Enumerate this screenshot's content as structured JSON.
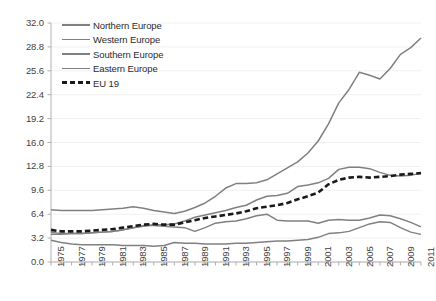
{
  "chart_data": {
    "type": "line",
    "title": "",
    "subtitle": "",
    "xlabel": "",
    "ylabel": "",
    "xlim": [
      1975,
      2011
    ],
    "ylim": [
      0.0,
      32.0
    ],
    "grid": true,
    "legend_position": "top-left",
    "y_ticks": [
      "0.0",
      "3.2",
      "6.4",
      "9.6",
      "12.8",
      "16.0",
      "19.2",
      "22.4",
      "25.6",
      "28.8",
      "32.0"
    ],
    "y_tick_values": [
      0.0,
      3.2,
      6.4,
      9.6,
      12.8,
      16.0,
      19.2,
      22.4,
      25.6,
      28.8,
      32.0
    ],
    "x_tick_labels": [
      "1975",
      "1977",
      "1979",
      "1981",
      "1983",
      "1985",
      "1987",
      "1989",
      "1991",
      "1993",
      "1995",
      "1997",
      "1999",
      "2001",
      "2003",
      "2005",
      "2007",
      "2009",
      "2011"
    ],
    "x": [
      1975,
      1976,
      1977,
      1978,
      1979,
      1980,
      1981,
      1982,
      1983,
      1984,
      1985,
      1986,
      1987,
      1988,
      1989,
      1990,
      1991,
      1992,
      1993,
      1994,
      1995,
      1996,
      1997,
      1998,
      1999,
      2000,
      2001,
      2002,
      2003,
      2004,
      2005,
      2006,
      2007,
      2008,
      2009,
      2010,
      2011
    ],
    "series": [
      {
        "name": "Northern Europe",
        "style": "solid",
        "color": "#808080",
        "values": [
          7.0,
          6.9,
          6.9,
          6.9,
          6.9,
          7.0,
          7.1,
          7.2,
          7.4,
          7.2,
          6.9,
          6.7,
          6.5,
          6.8,
          7.3,
          7.9,
          8.8,
          9.9,
          10.5,
          10.5,
          10.6,
          11.0,
          11.8,
          12.6,
          13.4,
          14.6,
          16.2,
          18.5,
          21.3,
          23.1,
          25.4,
          25.0,
          24.5,
          25.9,
          27.8,
          28.7,
          30.0
        ]
      },
      {
        "name": "Western Europe",
        "style": "solid",
        "color": "#808080",
        "values": [
          4.0,
          3.8,
          3.8,
          3.8,
          3.9,
          4.0,
          4.1,
          4.3,
          4.6,
          4.8,
          5.0,
          5.0,
          5.1,
          5.5,
          6.0,
          6.3,
          6.6,
          6.9,
          7.3,
          7.6,
          8.3,
          8.8,
          8.9,
          9.2,
          10.1,
          10.3,
          10.6,
          11.2,
          12.4,
          12.7,
          12.7,
          12.5,
          12.0,
          11.6,
          11.5,
          11.6,
          11.9
        ]
      },
      {
        "name": "Southern Europe",
        "style": "solid",
        "color": "#808080",
        "values": [
          3.7,
          3.7,
          3.8,
          3.8,
          3.9,
          4.0,
          4.1,
          4.3,
          4.6,
          4.9,
          4.9,
          4.8,
          4.7,
          4.6,
          4.1,
          4.6,
          5.2,
          5.4,
          5.5,
          5.8,
          6.2,
          6.4,
          5.6,
          5.5,
          5.5,
          5.5,
          5.2,
          5.6,
          5.7,
          5.6,
          5.6,
          5.9,
          6.3,
          6.2,
          5.8,
          5.3,
          4.7
        ]
      },
      {
        "name": "Eastern Europe",
        "style": "solid",
        "color": "#808080",
        "values": [
          2.9,
          2.6,
          2.4,
          2.3,
          2.3,
          2.3,
          2.3,
          2.2,
          2.2,
          2.2,
          2.1,
          2.2,
          2.6,
          2.5,
          2.5,
          2.4,
          2.4,
          2.4,
          2.5,
          2.5,
          2.6,
          2.7,
          2.8,
          2.8,
          2.9,
          3.0,
          3.3,
          3.8,
          3.9,
          4.1,
          4.6,
          5.1,
          5.4,
          5.3,
          4.6,
          4.0,
          3.7
        ]
      },
      {
        "name": "EU 19",
        "style": "dashed",
        "color": "#1a1a1a",
        "values": [
          4.3,
          4.1,
          4.1,
          4.1,
          4.2,
          4.3,
          4.4,
          4.6,
          4.8,
          5.0,
          5.1,
          5.0,
          5.0,
          5.3,
          5.6,
          5.9,
          6.1,
          6.3,
          6.5,
          6.8,
          7.2,
          7.4,
          7.6,
          7.9,
          8.4,
          8.8,
          9.3,
          10.4,
          11.0,
          11.3,
          11.4,
          11.3,
          11.4,
          11.5,
          11.7,
          11.8,
          11.9
        ]
      }
    ]
  },
  "legend": {
    "entries": [
      {
        "label": "Northern Europe",
        "style": "solid"
      },
      {
        "label": "Western Europe",
        "style": "solid"
      },
      {
        "label": "Southern Europe",
        "style": "solid"
      },
      {
        "label": "Eastern Europe",
        "style": "solid"
      },
      {
        "label": "EU 19",
        "style": "dashed"
      }
    ]
  },
  "colors": {
    "series_solid": "#808080",
    "series_dashed": "#1a1a1a",
    "gridline": "#f0f0f0",
    "axis": "#b0b0b0",
    "tick_text": "#3f3f3f",
    "background": "#ffffff"
  }
}
